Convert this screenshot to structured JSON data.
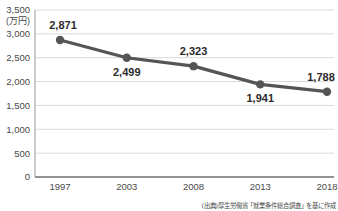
{
  "chart_data": {
    "type": "line",
    "title": "",
    "subtitle": "",
    "xlabel": "",
    "ylabel": "",
    "y_unit_label": "(万円)",
    "x_unit_label": "(年)",
    "categories": [
      "1997",
      "2003",
      "2008",
      "2013",
      "2018"
    ],
    "values": [
      2871,
      2499,
      2323,
      1941,
      1788
    ],
    "value_labels": [
      "2,871",
      "2,499",
      "2,323",
      "1,941",
      "1,788"
    ],
    "label_positions": [
      "above",
      "below",
      "above",
      "below",
      "above"
    ],
    "ylim": [
      0,
      3500
    ],
    "y_ticks": [
      0,
      500,
      1000,
      1500,
      2000,
      2500,
      3000,
      3500
    ],
    "y_tick_labels": [
      "0",
      "500",
      "1,000",
      "1,500",
      "2,000",
      "2,500",
      "3,000",
      "3,500"
    ],
    "grid": true,
    "legend": "none",
    "series": [
      {
        "name": "",
        "values": [
          2871,
          2499,
          2323,
          1941,
          1788
        ],
        "color": "#555555",
        "marker": "circle"
      }
    ],
    "annotations": [],
    "source_note": "(出典)厚生労働省「就業条件総合調査」を基に作成"
  },
  "colors": {
    "line": "#555555",
    "marker": "#555555",
    "grid": "#d9d9d9",
    "axis": "#6e6e6e",
    "text": "#3a3a3a",
    "background": "#ffffff"
  }
}
